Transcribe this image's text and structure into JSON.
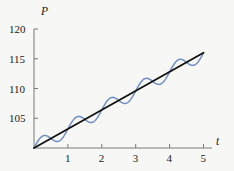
{
  "chart_data": {
    "type": "line",
    "title": "",
    "xlabel": "t",
    "ylabel": "P",
    "xlim": [
      0,
      5.25
    ],
    "ylim": [
      100,
      120
    ],
    "xticks": [
      1,
      2,
      3,
      4,
      5
    ],
    "yticks": [
      105,
      110,
      115,
      120
    ],
    "xtick_labels": [
      "1",
      "2",
      "3",
      "4",
      "5"
    ],
    "ytick_labels": [
      "105",
      "110",
      "115",
      "120"
    ],
    "grid": false,
    "legend": "none",
    "axis_origin_value": [
      0,
      100
    ],
    "series": [
      {
        "name": "trend-line",
        "style": "straight-line",
        "color": "#111111",
        "width": 1.8,
        "x": [
          0,
          5
        ],
        "values": [
          100,
          116
        ],
        "description": "P = 100 + 3.2 t"
      },
      {
        "name": "oscillating-population",
        "style": "sinusoid-about-trend",
        "color": "#6e8fc6",
        "width": 1.5,
        "amplitude": 1.2,
        "period": 1,
        "phase": 0,
        "x": [
          0,
          0.1,
          0.2,
          0.3,
          0.4,
          0.5,
          0.6,
          0.7,
          0.8,
          0.9,
          1.0,
          1.1,
          1.2,
          1.3,
          1.4,
          1.5,
          1.6,
          1.7,
          1.8,
          1.9,
          2.0,
          2.1,
          2.2,
          2.3,
          2.4,
          2.5,
          2.6,
          2.7,
          2.8,
          2.9,
          3.0,
          3.1,
          3.2,
          3.3,
          3.4,
          3.5,
          3.6,
          3.7,
          3.8,
          3.9,
          4.0,
          4.1,
          4.2,
          4.3,
          4.4,
          4.5,
          4.6,
          4.7,
          4.8,
          4.9,
          5.0
        ],
        "values": [
          100.0,
          101.02,
          101.46,
          101.29,
          100.72,
          100.08,
          99.78,
          100.02,
          100.74,
          101.63,
          102.22,
          102.24,
          101.78,
          101.22,
          100.96,
          101.18,
          101.78,
          102.48,
          102.94,
          103.0,
          102.72,
          102.36,
          102.21,
          102.4,
          102.89,
          103.48,
          103.93,
          104.05,
          103.88,
          103.6,
          103.44,
          103.55,
          103.92,
          104.44,
          104.89,
          105.11,
          105.07,
          104.89,
          104.73,
          104.74,
          104.97,
          105.37,
          105.81,
          106.14,
          106.26,
          106.2,
          106.05,
          105.97,
          106.06,
          106.33,
          106.71
        ]
      }
    ]
  },
  "axis": {
    "y_name": "P",
    "x_name": "t"
  }
}
